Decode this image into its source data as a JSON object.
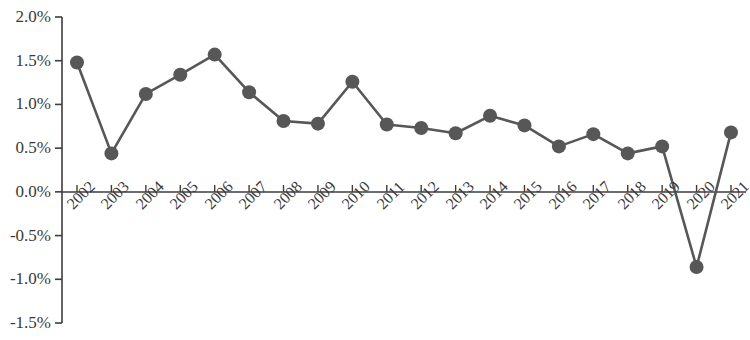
{
  "chart_data": {
    "type": "line",
    "title": "",
    "subtitle": "",
    "xlabel": "",
    "ylabel": "",
    "categories": [
      "2002",
      "2003",
      "2004",
      "2005",
      "2006",
      "2007",
      "2008",
      "2009",
      "2010",
      "2011",
      "2012",
      "2013",
      "2014",
      "2015",
      "2016",
      "2017",
      "2018",
      "2019",
      "2020",
      "2021"
    ],
    "values": [
      1.48,
      0.44,
      1.12,
      1.34,
      1.57,
      1.14,
      0.81,
      0.78,
      1.26,
      0.77,
      0.73,
      0.67,
      0.87,
      0.76,
      0.52,
      0.66,
      0.44,
      0.52,
      -0.86,
      0.68
    ],
    "value_unit": "%",
    "series": [
      {
        "name": "",
        "values": [
          1.48,
          0.44,
          1.12,
          1.34,
          1.57,
          1.14,
          0.81,
          0.78,
          1.26,
          0.77,
          0.73,
          0.67,
          0.87,
          0.76,
          0.52,
          0.66,
          0.44,
          0.52,
          -0.86,
          0.68
        ],
        "color": "#575757",
        "marker": "circle"
      }
    ],
    "ylim": [
      -1.5,
      2.0
    ],
    "yticks": [
      2.0,
      1.5,
      1.0,
      0.5,
      0.0,
      -0.5,
      -1.0,
      -1.5
    ],
    "ytick_labels": [
      "2.0%",
      "1.5%",
      "1.0%",
      "0.5%",
      "0.0%",
      "-0.5%",
      "-1.0%",
      "-1.5%"
    ],
    "xtick_labels": [
      "2002",
      "2003",
      "2004",
      "2005",
      "2006",
      "2007",
      "2008",
      "2009",
      "2010",
      "2011",
      "2012",
      "2013",
      "2014",
      "2015",
      "2016",
      "2017",
      "2018",
      "2019",
      "2020",
      "2021"
    ],
    "grid": false,
    "legend": false,
    "legend_position": "none",
    "zero_line": true,
    "line_color": "#575757",
    "marker_color": "#575757",
    "axis_color": "#3d3d3d"
  }
}
